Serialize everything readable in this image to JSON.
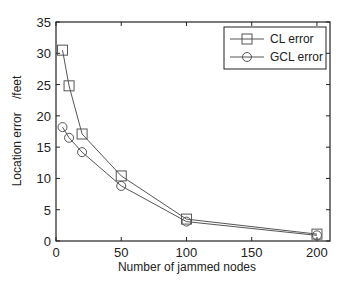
{
  "chart_data": {
    "type": "line",
    "title": "",
    "xlabel": "Number of jammed nodes",
    "ylabel": "Location error    /feet",
    "xlim": [
      0,
      210
    ],
    "ylim": [
      0,
      35
    ],
    "xticks": [
      0,
      50,
      100,
      150,
      200
    ],
    "yticks": [
      0,
      5,
      10,
      15,
      20,
      25,
      30,
      35
    ],
    "grid": false,
    "legend_position": "upper right",
    "x": [
      5,
      10,
      20,
      50,
      100,
      200
    ],
    "series": [
      {
        "name": "CL error",
        "marker": "square",
        "values": [
          30.5,
          24.8,
          17.1,
          10.4,
          3.5,
          1.1
        ]
      },
      {
        "name": "GCL error",
        "marker": "circle",
        "values": [
          18.2,
          16.5,
          14.2,
          8.8,
          3.1,
          0.9
        ]
      }
    ]
  },
  "colors": {
    "line": "#555555",
    "axis": "#222222",
    "background": "#ffffff"
  }
}
